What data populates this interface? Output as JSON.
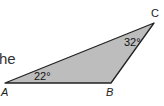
{
  "text_fragment": "he",
  "triangle": {
    "fill": "#bdbdbd",
    "stroke": "#222222",
    "vertices": {
      "A": {
        "label": "A",
        "x": 5,
        "y": 83
      },
      "B": {
        "label": "B",
        "x": 111,
        "y": 83
      },
      "C": {
        "label": "C",
        "x": 154,
        "y": 23
      }
    },
    "angles": {
      "A": "22°",
      "C": "32°"
    }
  }
}
